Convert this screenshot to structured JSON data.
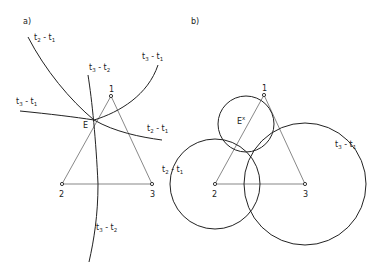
{
  "panels": {
    "a": {
      "label": "a)",
      "points": [
        {
          "id": "1",
          "label": "1",
          "x": 111,
          "y": 96
        },
        {
          "id": "2",
          "label": "2",
          "x": 62,
          "y": 184
        },
        {
          "id": "3",
          "label": "3",
          "x": 152,
          "y": 184
        }
      ],
      "estimate": {
        "label": "E",
        "x": 94,
        "y": 120
      },
      "curves": {
        "t2_t1_upper": {
          "label_main": "t",
          "sub1": "2",
          "sep": " - t",
          "sub2": "1"
        },
        "t3_t2": {
          "label_main": "t",
          "sub1": "3",
          "sep": " - t",
          "sub2": "2"
        },
        "t3_t1_upper": {
          "label_main": "t",
          "sub1": "3",
          "sep": " - t",
          "sub2": "1"
        },
        "t3_t1_left": {
          "label_main": "t",
          "sub1": "3",
          "sep": " - t",
          "sub2": "1"
        },
        "t2_t1_lower": {
          "label_main": "t",
          "sub1": "2",
          "sep": " - t",
          "sub2": "1"
        },
        "t3_t2_lower": {
          "label_main": "t",
          "sub1": "3",
          "sep": " - t",
          "sub2": "2"
        }
      }
    },
    "b": {
      "label": "b)",
      "points": [
        {
          "id": "1",
          "label": "1",
          "x": 264,
          "y": 95
        },
        {
          "id": "2",
          "label": "2",
          "x": 215,
          "y": 184
        },
        {
          "id": "3",
          "label": "3",
          "x": 305,
          "y": 184
        }
      ],
      "estimate": {
        "label": "E",
        "sup": "x"
      },
      "circles": [
        {
          "name": "station-1-circle",
          "cx": 246,
          "cy": 124,
          "r": 28
        },
        {
          "name": "t2-t1-circle",
          "cx": 215,
          "cy": 184,
          "r": 45,
          "label_main": "t",
          "sub1": "2",
          "sep": " - t",
          "sub2": "1"
        },
        {
          "name": "t3-t1-circle",
          "cx": 305,
          "cy": 184,
          "r": 61,
          "label_main": "t",
          "sub1": "3",
          "sep": " - t",
          "sub2": "1"
        }
      ]
    }
  }
}
